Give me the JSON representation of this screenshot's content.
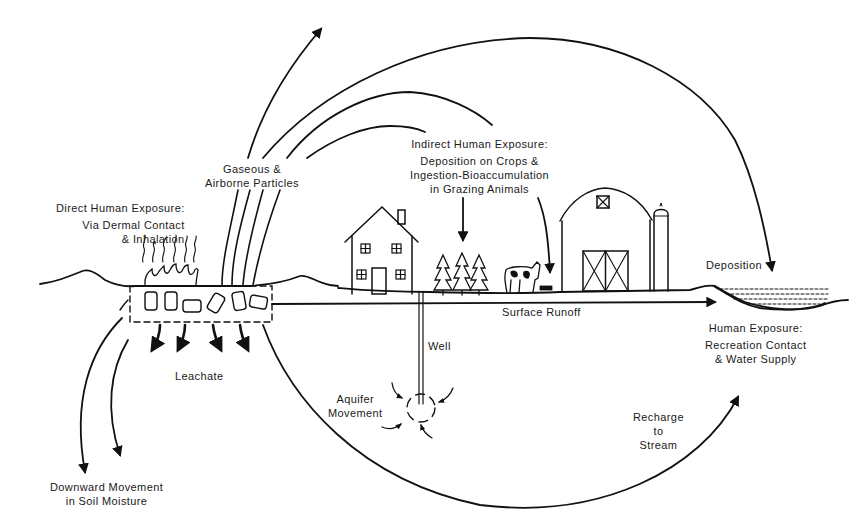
{
  "diagram": {
    "type": "flow-diagram",
    "colors": {
      "ink": "#111111",
      "background": "#ffffff"
    }
  },
  "labels": {
    "gaseous": {
      "line1": "Gaseous &",
      "line2": "Airborne Particles"
    },
    "direct": {
      "title": "Direct Human Exposure:",
      "line1": "Via Dermal Contact",
      "line2": "& Inhalation"
    },
    "indirect": {
      "title": "Indirect Human Exposure:",
      "line1": "Deposition on Crops &",
      "line2": "Ingestion-Bioaccumulation",
      "line3": "in Grazing Animals"
    },
    "deposition": "Deposition",
    "surface_runoff": "Surface Runoff",
    "water_exposure": {
      "title": "Human Exposure:",
      "line1": "Recreation Contact",
      "line2": "& Water Supply"
    },
    "well": "Well",
    "leachate": "Leachate",
    "aquifer": {
      "line1": "Aquifer",
      "line2": "Movement"
    },
    "recharge": {
      "line1": "Recharge",
      "line2": "to",
      "line3": "Stream"
    },
    "downward": {
      "line1": "Downward Movement",
      "line2": "in Soil Moisture"
    }
  },
  "nodes": [
    {
      "id": "waste-site",
      "label": "Buried waste drums (dashed boundary)"
    },
    {
      "id": "house",
      "label": "House"
    },
    {
      "id": "crops",
      "label": "Crops (three trees)"
    },
    {
      "id": "cow",
      "label": "Grazing animal"
    },
    {
      "id": "barn",
      "label": "Barn"
    },
    {
      "id": "silo",
      "label": "Silo"
    },
    {
      "id": "stream",
      "label": "Stream / water body"
    },
    {
      "id": "well",
      "label": "Well"
    },
    {
      "id": "aquifer",
      "label": "Aquifer"
    }
  ],
  "edges": [
    {
      "from": "waste-site",
      "to": "atmosphere",
      "label": "Gaseous & Airborne Particles"
    },
    {
      "from": "waste-site",
      "to": "stream",
      "label": "Deposition"
    },
    {
      "from": "waste-site",
      "to": "crops",
      "label": "Indirect Human Exposure"
    },
    {
      "from": "waste-site",
      "to": "stream",
      "label": "Surface Runoff"
    },
    {
      "from": "waste-site",
      "to": "groundwater",
      "label": "Leachate"
    },
    {
      "from": "waste-site",
      "to": "soil",
      "label": "Downward Movement in Soil Moisture"
    },
    {
      "from": "waste-site",
      "to": "stream",
      "label": "Recharge to Stream"
    },
    {
      "from": "aquifer",
      "to": "well",
      "label": "Aquifer Movement"
    }
  ]
}
